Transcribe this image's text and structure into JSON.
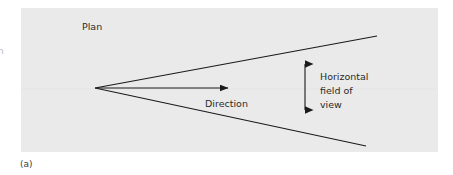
{
  "figure": {
    "caption": "(a)",
    "panel": {
      "fill_color": "#eaeaea",
      "x": 21,
      "y": 8,
      "width": 417,
      "height": 144
    },
    "edge_fragment_text": "n"
  },
  "labels": {
    "plan": "Plan",
    "direction": "Direction",
    "field_of_view_line1": "Horizontal",
    "field_of_view_line2": "field of",
    "field_of_view_line3": "view"
  },
  "diagram": {
    "type": "schematic",
    "line_color": "#1a1a1a",
    "apex": {
      "x": 95,
      "y": 88
    },
    "upper_edge_end": {
      "x": 377,
      "y": 36
    },
    "lower_edge_end": {
      "x": 366,
      "y": 146
    },
    "direction_arrow": {
      "from": {
        "x": 97,
        "y": 88
      },
      "to": {
        "x": 230,
        "y": 88
      }
    },
    "fov_double_arrow": {
      "x": 305,
      "top_y": 55,
      "bottom_y": 119
    }
  }
}
